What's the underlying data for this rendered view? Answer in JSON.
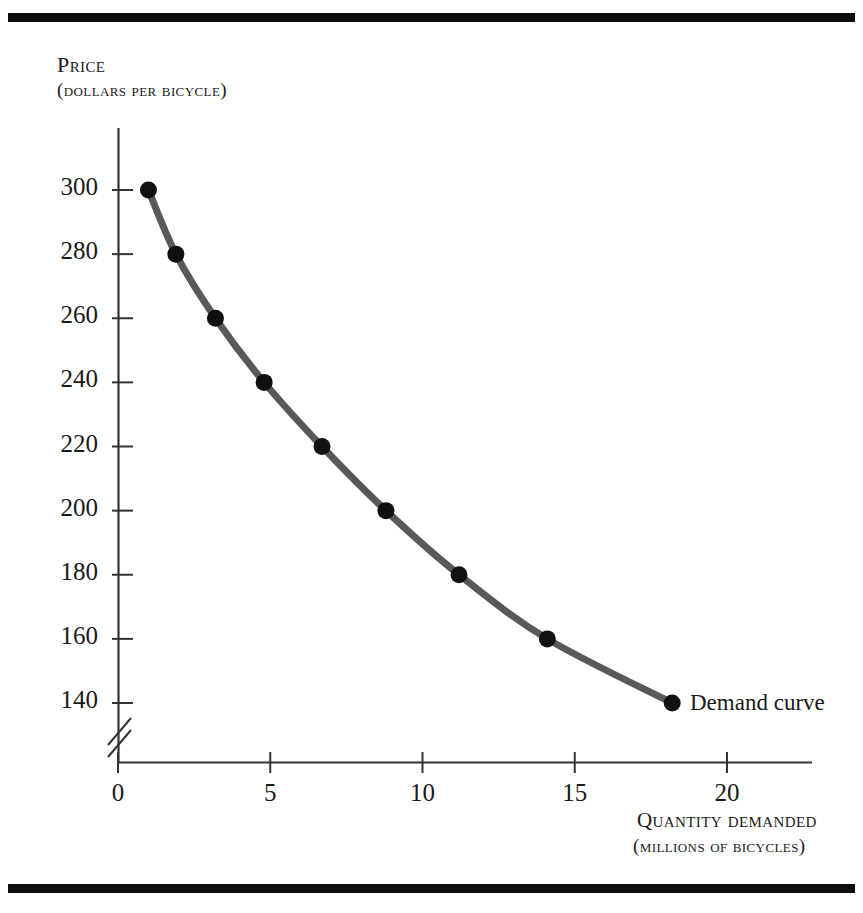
{
  "figure": {
    "background_color": "#ffffff",
    "rule_color": "#0d0d0d",
    "curve_color": "#595959",
    "point_color": "#111111",
    "axis_color": "#333333"
  },
  "axes": {
    "y": {
      "title": "Price",
      "subtitle": "(dollars per bicycle)",
      "ticks": [
        300,
        280,
        260,
        240,
        220,
        200,
        180,
        160,
        140
      ],
      "tick_labels": [
        "300",
        "280",
        "260",
        "240",
        "220",
        "200",
        "180",
        "160",
        "140"
      ],
      "has_axis_break": true,
      "break_symbol": "//"
    },
    "x": {
      "title": "Quantity demanded",
      "subtitle": "(millions of bicycles)",
      "ticks": [
        0,
        5,
        10,
        15,
        20
      ],
      "tick_labels": [
        "0",
        "5",
        "10",
        "15",
        "20"
      ]
    }
  },
  "annotations": {
    "curve_label": "Demand curve"
  },
  "chart_data": {
    "type": "line",
    "title": "",
    "subtitle": "",
    "xlabel": "Quantity demanded (millions of bicycles)",
    "ylabel": "Price (dollars per bicycle)",
    "xlim": [
      0,
      22.8
    ],
    "ylim": [
      130,
      310
    ],
    "grid": false,
    "legend": null,
    "series": [
      {
        "name": "Demand curve",
        "marker": "filled-circle",
        "x": [
          1.0,
          1.9,
          3.2,
          4.8,
          6.7,
          8.8,
          11.2,
          14.1,
          18.2
        ],
        "y": [
          300,
          280,
          260,
          240,
          220,
          200,
          180,
          160,
          140
        ]
      }
    ],
    "points": [
      {
        "quantity": 1.0,
        "price": 300
      },
      {
        "quantity": 1.9,
        "price": 280
      },
      {
        "quantity": 3.2,
        "price": 260
      },
      {
        "quantity": 4.8,
        "price": 240
      },
      {
        "quantity": 6.7,
        "price": 220
      },
      {
        "quantity": 8.8,
        "price": 200
      },
      {
        "quantity": 11.2,
        "price": 180
      },
      {
        "quantity": 14.1,
        "price": 160
      },
      {
        "quantity": 18.2,
        "price": 140
      }
    ]
  }
}
